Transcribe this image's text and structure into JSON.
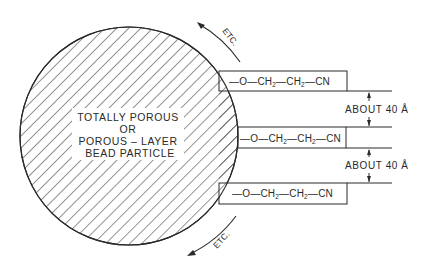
{
  "diagram": {
    "particle": {
      "label_lines": [
        "TOTALLY POROUS",
        "OR",
        "POROUS – LAYER",
        "BEAD PARTICLE"
      ]
    },
    "chains": [
      {
        "parts": [
          "—O—CH",
          "2",
          "—CH",
          "2",
          "—CN"
        ]
      },
      {
        "parts": [
          "—O—CH",
          "2",
          "—CH",
          "2",
          "—CN"
        ]
      },
      {
        "parts": [
          "—O—CH",
          "2",
          "—CH",
          "2",
          "—CN"
        ]
      }
    ],
    "dimensions": [
      {
        "label": "ABOUT 40 Å"
      },
      {
        "label": "ABOUT 40 Å"
      }
    ],
    "continuation": {
      "top": "ETC.",
      "bottom": "ETC."
    },
    "colors": {
      "ink": "#2a2a2a",
      "background": "#ffffff"
    }
  }
}
